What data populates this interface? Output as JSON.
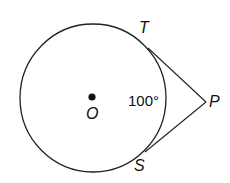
{
  "diagram": {
    "type": "geometry",
    "labels": {
      "center": "O",
      "tangent_top": "T",
      "tangent_bottom": "S",
      "external_point": "P",
      "arc_measure": "100°"
    },
    "colors": {
      "stroke": "#222222",
      "background": "#ffffff"
    }
  }
}
